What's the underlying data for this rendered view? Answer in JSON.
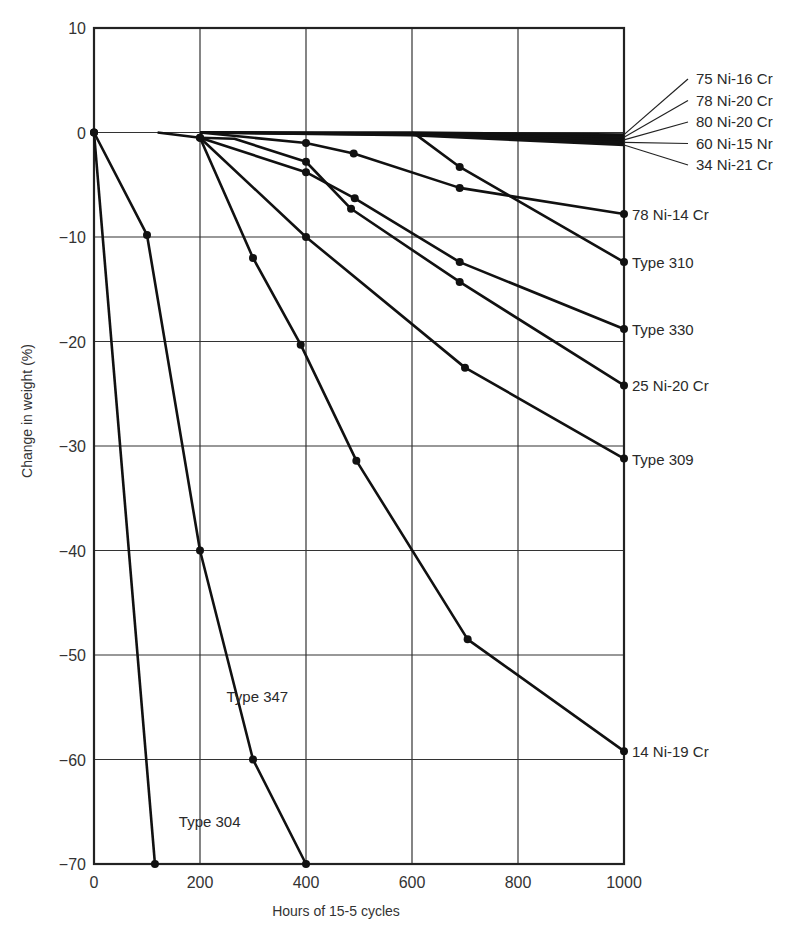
{
  "chart_data": {
    "type": "line",
    "title": "",
    "xlabel": "Hours of 15-5 cycles",
    "ylabel": "Change in weight (%)",
    "xlim": [
      0,
      1000
    ],
    "ylim": [
      -70,
      10
    ],
    "xticks": [
      0,
      200,
      400,
      600,
      800,
      1000
    ],
    "xtick_labels": [
      "0",
      "200",
      "400",
      "600",
      "800",
      "1000"
    ],
    "yticks": [
      10,
      0,
      -10,
      -20,
      -30,
      -40,
      -50,
      -60,
      -70
    ],
    "ytick_labels": [
      "10",
      "0",
      "−10",
      "−20",
      "−30",
      "−40",
      "−50",
      "−60",
      "−70"
    ],
    "grid": true,
    "legend": "direct labels at right end of lines",
    "series": [
      {
        "name": "75 Ni-16 Cr",
        "label_side": "right-leader",
        "points": [
          [
            200,
            0
          ],
          [
            600,
            0
          ],
          [
            1000,
            -0.2
          ]
        ],
        "markers": false
      },
      {
        "name": "78 Ni-20 Cr",
        "label_side": "right-leader",
        "points": [
          [
            200,
            0
          ],
          [
            600,
            -0.1
          ],
          [
            1000,
            -0.45
          ]
        ],
        "markers": false
      },
      {
        "name": "80 Ni-20 Cr",
        "label_side": "right-leader",
        "points": [
          [
            200,
            0
          ],
          [
            600,
            -0.15
          ],
          [
            1000,
            -0.7
          ]
        ],
        "markers": false
      },
      {
        "name": "60 Ni-15 Nr",
        "label_side": "right-leader",
        "points": [
          [
            200,
            0
          ],
          [
            600,
            -0.2
          ],
          [
            1000,
            -0.95
          ]
        ],
        "markers": false
      },
      {
        "name": "34 Ni-21 Cr",
        "label_side": "right-leader",
        "points": [
          [
            200,
            0
          ],
          [
            600,
            -0.25
          ],
          [
            1000,
            -1.2
          ]
        ],
        "markers": false
      },
      {
        "name": "78 Ni-14 Cr",
        "label_side": "right",
        "points": [
          [
            200,
            0
          ],
          [
            400,
            -1.0
          ],
          [
            490,
            -2.0
          ],
          [
            690,
            -5.3
          ],
          [
            1000,
            -7.8
          ]
        ],
        "markers": [
          400,
          490,
          690,
          1000
        ]
      },
      {
        "name": "Type 310",
        "label_side": "right",
        "points": [
          [
            600,
            0
          ],
          [
            610,
            -0.3
          ],
          [
            690,
            -3.3
          ],
          [
            1000,
            -12.4
          ]
        ],
        "markers": [
          690,
          1000
        ]
      },
      {
        "name": "Type 330",
        "label_side": "right",
        "points": [
          [
            120,
            0
          ],
          [
            200,
            -0.5
          ],
          [
            400,
            -3.8
          ],
          [
            492,
            -6.3
          ],
          [
            690,
            -12.4
          ],
          [
            1000,
            -18.8
          ]
        ],
        "markers": [
          200,
          400,
          492,
          690,
          1000
        ]
      },
      {
        "name": "25 Ni-20 Cr",
        "label_side": "right",
        "points": [
          [
            200,
            -0.5
          ],
          [
            265,
            -0.6
          ],
          [
            400,
            -2.8
          ],
          [
            485,
            -7.3
          ],
          [
            690,
            -14.3
          ],
          [
            1000,
            -24.2
          ]
        ],
        "markers": [
          400,
          485,
          690,
          1000
        ]
      },
      {
        "name": "Type 309",
        "label_side": "right",
        "points": [
          [
            200,
            -0.5
          ],
          [
            400,
            -10.0
          ],
          [
            700,
            -22.5
          ],
          [
            1000,
            -31.2
          ]
        ],
        "markers": [
          200,
          400,
          700,
          1000
        ]
      },
      {
        "name": "14 Ni-19 Cr",
        "label_side": "right",
        "points": [
          [
            200,
            -0.5
          ],
          [
            300,
            -12.0
          ],
          [
            390,
            -20.3
          ],
          [
            495,
            -31.4
          ],
          [
            705,
            -48.5
          ],
          [
            1000,
            -59.2
          ]
        ],
        "markers": [
          300,
          390,
          495,
          705,
          1000
        ]
      },
      {
        "name": "Type 347",
        "label_side": "inline",
        "label_at": [
          250,
          -54.5
        ],
        "points": [
          [
            0,
            0
          ],
          [
            100,
            -9.8
          ],
          [
            200,
            -40.0
          ],
          [
            300,
            -60.0
          ],
          [
            400,
            -70.0
          ]
        ],
        "markers": [
          0,
          100,
          200,
          300,
          400
        ]
      },
      {
        "name": "Type 304",
        "label_side": "inline",
        "label_at": [
          160,
          -66.5
        ],
        "points": [
          [
            0,
            0
          ],
          [
            115,
            -70.0
          ]
        ],
        "markers": [
          0,
          115
        ]
      }
    ]
  }
}
